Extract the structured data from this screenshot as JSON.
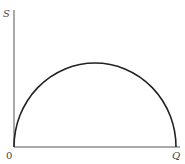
{
  "diagram": {
    "type": "semicircle-curve",
    "axes": {
      "y_label": "S",
      "origin_label": "0",
      "x_end_label": "Q"
    },
    "curve": {
      "shape": "semicircle",
      "start": [
        0,
        0
      ],
      "end": "Q",
      "peak_at": "Q/2"
    },
    "colors": {
      "axis": "#555555",
      "curve": "#222222",
      "label": "#444444"
    }
  }
}
